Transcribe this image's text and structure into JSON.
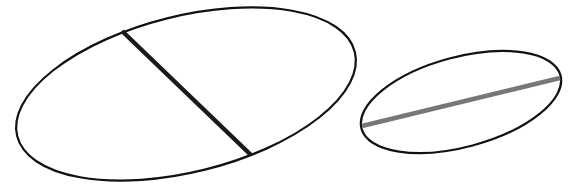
{
  "diagram": {
    "background": "#ffffff",
    "shapes": [
      {
        "id": "large-ellipse",
        "type": "ellipse",
        "cx": 186,
        "cy": 94,
        "rx": 174,
        "ry": 78,
        "rotate": -14,
        "stroke": "#111111",
        "stroke_width": 2.2,
        "segment": {
          "x1": 122,
          "y1": 31,
          "x2": 251,
          "y2": 155,
          "stroke": "#1a1a1a",
          "stroke_width": 4.5,
          "kind": "minor-axis"
        }
      },
      {
        "id": "small-ellipse",
        "type": "ellipse",
        "cx": 461,
        "cy": 102,
        "rx": 103,
        "ry": 45,
        "rotate": -15,
        "stroke": "#111111",
        "stroke_width": 2.2,
        "segment": {
          "x1": 362,
          "y1": 126,
          "x2": 560,
          "y2": 78,
          "stroke": "#777777",
          "stroke_width": 4.5,
          "kind": "major-axis"
        }
      }
    ]
  }
}
